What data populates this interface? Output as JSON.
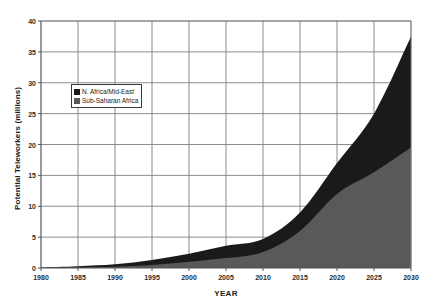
{
  "chart_data": {
    "type": "area",
    "title": "",
    "subtitle": "",
    "xlabel": "YEAR",
    "ylabel": "Potential Teleworkers (millions)",
    "stacked": true,
    "grid": true,
    "legend_position": "upper-left-inside",
    "xlim": [
      1980,
      2030
    ],
    "ylim": [
      0,
      40
    ],
    "xticks": [
      1980,
      1985,
      1990,
      1995,
      2000,
      2005,
      2010,
      2015,
      2020,
      2025,
      2030
    ],
    "yticks": [
      0,
      5,
      10,
      15,
      20,
      25,
      30,
      35,
      40
    ],
    "x": [
      1980,
      1985,
      1990,
      1995,
      2000,
      2005,
      2010,
      2015,
      2020,
      2025,
      2030
    ],
    "series": [
      {
        "name": "Sub-Saharan Africa",
        "color": "#595959",
        "values": [
          0.05,
          0.1,
          0.2,
          0.5,
          1.0,
          1.6,
          2.6,
          6.0,
          12.0,
          15.5,
          19.5
        ]
      },
      {
        "name": "N. Africa/Mid-East",
        "color": "#1a1a1a",
        "values": [
          0.05,
          0.2,
          0.4,
          0.8,
          1.3,
          2.0,
          2.1,
          3.0,
          5.0,
          9.5,
          18.0
        ]
      }
    ],
    "totals": [
      0.1,
      0.3,
      0.6,
      1.3,
      2.3,
      3.6,
      4.7,
      9.0,
      17.0,
      25.0,
      37.5
    ],
    "colors": {
      "north_africa_mid_east": "#1a1a1a",
      "sub_saharan_africa": "#595959",
      "gridline": "#808080",
      "axis": "#555555",
      "background": "#ffffff"
    }
  },
  "legend": {
    "items": [
      {
        "label": "N. Africa/Mid-East",
        "swatch": "#1a1a1a"
      },
      {
        "label": "Sub-Saharan Africa",
        "swatch": "#595959"
      }
    ]
  },
  "axes": {
    "y_title": "Potential Teleworkers (millions)",
    "x_title": "YEAR",
    "y_tick_labels": [
      "0",
      "5",
      "10",
      "15",
      "20",
      "25",
      "30",
      "35",
      "40"
    ],
    "x_tick_labels": [
      "1980",
      "1985",
      "1990",
      "1995",
      "2000",
      "2005",
      "2010",
      "2015",
      "2020",
      "2025",
      "2030"
    ]
  }
}
